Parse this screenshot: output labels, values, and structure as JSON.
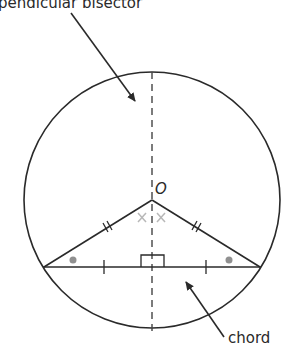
{
  "labels": {
    "top": "pendicular bisector",
    "center": "O",
    "chord": "chord"
  },
  "colors": {
    "line": "#2a2a2a",
    "dash": "#444444",
    "angle_cross": "#b8b8b8",
    "dot": "#909090"
  },
  "geometry": {
    "circle": {
      "cx": 152,
      "cy": 200,
      "r": 128
    },
    "center_point": {
      "x": 152,
      "y": 200
    },
    "chord": {
      "x1": 43,
      "y1": 267,
      "x2": 261,
      "y2": 267
    }
  }
}
